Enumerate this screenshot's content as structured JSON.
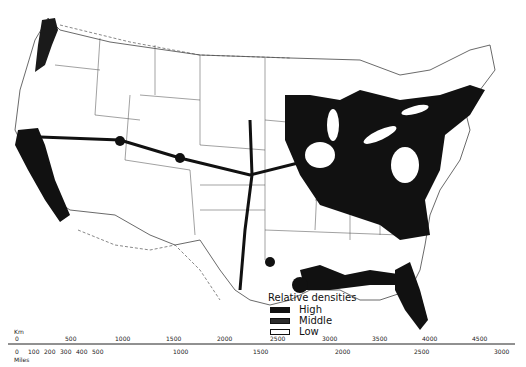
{
  "map": {
    "subject": "Relative population densities, conterminous United States",
    "colors": {
      "high": "#111111",
      "middle": "#2a2a2a",
      "low": "#ffffff",
      "lines": "#333333"
    }
  },
  "legend": {
    "title": "Relative densities",
    "items": [
      {
        "label": "High",
        "swatch": "#111111"
      },
      {
        "label": "Middle",
        "swatch": "#2a2a2a"
      },
      {
        "label": "Low",
        "swatch": "#ffffff"
      }
    ]
  },
  "scale": {
    "km_label": "Km",
    "miles_label": "Miles",
    "km_ticks": [
      "0",
      "500",
      "1000",
      "1500",
      "2000",
      "2500",
      "3000",
      "3500",
      "4000",
      "4500"
    ],
    "miles_ticks": [
      "0",
      "100",
      "200",
      "300",
      "400",
      "500",
      "1000",
      "1500",
      "2000",
      "2500",
      "3000"
    ]
  }
}
